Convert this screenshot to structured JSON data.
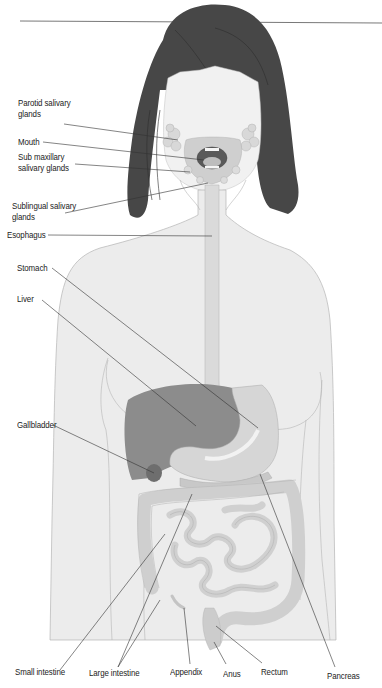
{
  "diagram": {
    "labels": {
      "parotid": "Parotid salivary\nglands",
      "mouth": "Mouth",
      "submaxillary": "Sub maxillary\nsalivary glands",
      "sublingual": "Sublingual salivary\nglands",
      "esophagus": "Esophagus",
      "stomach": "Stomach",
      "liver": "Liver",
      "gallbladder": "Gallbladder",
      "small_intestine": "Small intestine",
      "large_intestine": "Large intestine",
      "appendix": "Appendix",
      "anus": "Anus",
      "rectum": "Rectum",
      "pancreas": "Pancreas"
    },
    "colors": {
      "hair": "#474747",
      "skin": "#ececec",
      "outline": "#b5b5b5",
      "organ_light": "#d4d4d4",
      "liver": "#8c8c8c",
      "gallbladder": "#6e6e6e",
      "leader": "#333333"
    }
  }
}
